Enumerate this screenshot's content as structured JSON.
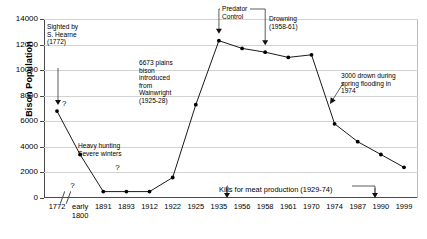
{
  "chart_data": {
    "type": "line",
    "title": "",
    "xlabel": "",
    "ylabel": "Bison Population",
    "ylim": [
      0,
      14000
    ],
    "ytick_labels": [
      "0",
      "2000",
      "4000",
      "6000",
      "8000",
      "10000",
      "12000",
      "14000"
    ],
    "ytick_values": [
      0,
      2000,
      4000,
      6000,
      8000,
      10000,
      12000,
      14000
    ],
    "grid": true,
    "legend": "none",
    "x_axis_break_after_index": 0,
    "categories": [
      "1772",
      "early\n1800",
      "1891",
      "1893",
      "1912",
      "1922",
      "1925",
      "1935",
      "1956",
      "1958",
      "1961",
      "1970",
      "1974",
      "1987",
      "1990",
      "1999"
    ],
    "values": [
      6800,
      3400,
      500,
      500,
      500,
      1600,
      7300,
      12300,
      11700,
      11400,
      11000,
      11200,
      5800,
      4400,
      3400,
      2400
    ],
    "point_markers": [
      {
        "category": "1772",
        "value": 6800,
        "note": "?"
      },
      {
        "category": "early 1800",
        "value": 3400,
        "note": "?"
      },
      {
        "category": "1891",
        "value": 500,
        "note": "?"
      },
      {
        "category": "1893",
        "value": 500,
        "note": ""
      },
      {
        "category": "1912",
        "value": 500,
        "note": ""
      },
      {
        "category": "1922",
        "value": 1600,
        "note": ""
      },
      {
        "category": "1925",
        "value": 7300,
        "note": ""
      },
      {
        "category": "1935",
        "value": 12300,
        "note": ""
      },
      {
        "category": "1956",
        "value": 11700,
        "note": ""
      },
      {
        "category": "1958",
        "value": 11400,
        "note": ""
      },
      {
        "category": "1961",
        "value": 11000,
        "note": ""
      },
      {
        "category": "1970",
        "value": 11200,
        "note": ""
      },
      {
        "category": "1974",
        "value": 5800,
        "note": ""
      },
      {
        "category": "1987",
        "value": 4400,
        "note": ""
      },
      {
        "category": "1990",
        "value": 3400,
        "note": ""
      },
      {
        "category": "1999",
        "value": 2400,
        "note": ""
      }
    ],
    "annotations": [
      {
        "id": "hearne",
        "text": "Sighted by\nS. Hearne\n(1772)",
        "points_to": "1772"
      },
      {
        "id": "heavy_hunting",
        "text": "Heavy hunting\nSevere winters",
        "points_to": "early 1800"
      },
      {
        "id": "wainwright",
        "text": "6673 plains\nbison\nintroduced\nfrom\nWainwright\n(1925-28)",
        "points_to": "1925"
      },
      {
        "id": "predator_control",
        "text": "Predator\nControl",
        "points_to": "1935-1958"
      },
      {
        "id": "drowning",
        "text": "Drowning\n(1958-61)",
        "points_to": "1958"
      },
      {
        "id": "flood",
        "text": "3000 drown during\nspring flooding in\n1974",
        "points_to": "1974"
      },
      {
        "id": "kills",
        "text": "Kills for meat production (1929-74)",
        "points_to": "1929-1974"
      }
    ],
    "question_marks": [
      "1772",
      "early 1800",
      "1891"
    ]
  },
  "axis": {
    "y_title": "Bison Population"
  },
  "colors": {
    "line": "#1a1a1a",
    "marker": "#000000",
    "grid": "#d2d2d2",
    "axis": "#4a4a4a",
    "background": "#ffffff"
  }
}
